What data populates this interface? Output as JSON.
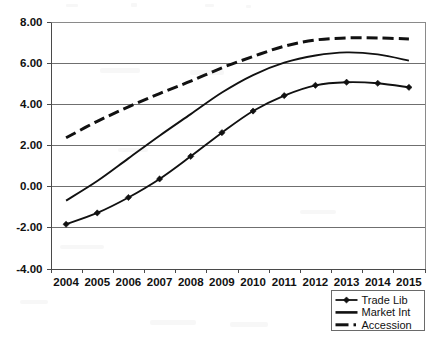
{
  "chart_data": {
    "type": "line",
    "title": "",
    "subtitle": "",
    "xlabel": "",
    "ylabel": "",
    "categories": [
      "2004",
      "2005",
      "2006",
      "2007",
      "2008",
      "2009",
      "2010",
      "2011",
      "2012",
      "2013",
      "2014",
      "2015"
    ],
    "ylim": [
      -4.0,
      8.0
    ],
    "ytick_labels": [
      "8.00",
      "6.00",
      "4.00",
      "2.00",
      "0.00",
      "-2.00",
      "-4.00"
    ],
    "ytick_values": [
      8.0,
      6.0,
      4.0,
      2.0,
      0.0,
      -2.0,
      -4.0
    ],
    "grid": true,
    "grid_axis": "y",
    "legend_position": "bottom-right",
    "series": [
      {
        "name": "Trade Lib",
        "style": "solid-with-markers",
        "marker": "diamond",
        "color": "#111111",
        "values": [
          -1.85,
          -1.3,
          -0.55,
          0.35,
          1.45,
          2.6,
          3.65,
          4.4,
          4.9,
          5.05,
          5.0,
          4.8
        ]
      },
      {
        "name": "Market Int",
        "style": "solid",
        "marker": "none",
        "color": "#111111",
        "values": [
          -0.7,
          0.25,
          1.35,
          2.45,
          3.5,
          4.55,
          5.4,
          6.0,
          6.35,
          6.5,
          6.4,
          6.1
        ]
      },
      {
        "name": "Accession",
        "style": "dashed",
        "marker": "none",
        "color": "#111111",
        "values": [
          2.35,
          3.15,
          3.85,
          4.5,
          5.1,
          5.75,
          6.3,
          6.8,
          7.1,
          7.2,
          7.2,
          7.15
        ]
      }
    ]
  },
  "legend": {
    "items": [
      {
        "label": "Trade Lib",
        "swatch": "line-with-marker"
      },
      {
        "label": "Market Int",
        "swatch": "solid-line"
      },
      {
        "label": "Accession",
        "swatch": "dash-dot-line"
      }
    ]
  }
}
